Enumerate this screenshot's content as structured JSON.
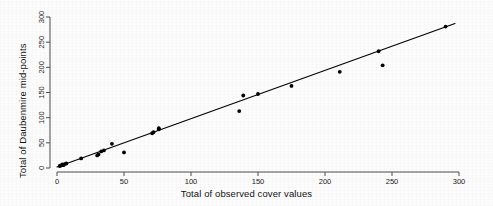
{
  "chart_data": {
    "type": "scatter",
    "title": "",
    "xlabel": "Total of observed cover values",
    "ylabel": "Total of Daubenmire mid-points",
    "xlim": [
      0,
      300
    ],
    "ylim": [
      0,
      300
    ],
    "xticks": [
      0,
      50,
      100,
      150,
      200,
      250,
      300
    ],
    "yticks": [
      0,
      50,
      100,
      150,
      200,
      250,
      300
    ],
    "grid": false,
    "legend": null,
    "marker": "filled-circle",
    "marker_color": "#000000",
    "series": [
      {
        "name": "observations",
        "x": [
          2,
          3,
          4,
          4,
          5,
          6,
          7,
          18,
          30,
          31,
          33,
          35,
          41,
          50,
          71,
          72,
          76,
          76,
          136,
          139,
          150,
          175,
          211,
          240,
          243,
          290
        ],
        "y": [
          4,
          5,
          6,
          7,
          6,
          8,
          9,
          19,
          25,
          27,
          33,
          35,
          48,
          31,
          69,
          71,
          77,
          79,
          113,
          144,
          147,
          163,
          191,
          232,
          204,
          281
        ]
      }
    ],
    "fit_line": {
      "name": "regression line",
      "color": "#000000",
      "x_start": 0,
      "x_end": 297,
      "y_start": 2,
      "y_end": 287
    }
  },
  "axes": {
    "x_tick_labels": [
      "0",
      "50",
      "100",
      "150",
      "200",
      "250",
      "300"
    ],
    "y_tick_labels": [
      "0",
      "50",
      "100",
      "150",
      "200",
      "250",
      "300"
    ]
  }
}
